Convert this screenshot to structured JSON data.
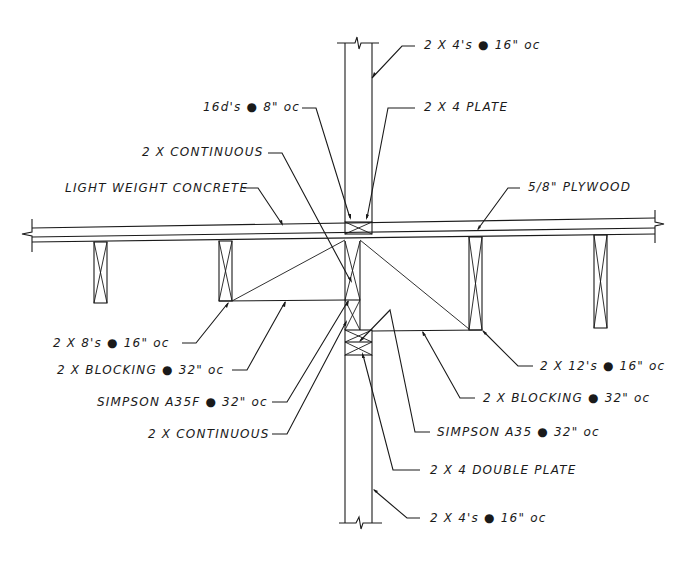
{
  "drawing": {
    "title": "Floor / wall framing section detail",
    "line_color": "#1a1a1a",
    "background": "#ffffff"
  },
  "labels": {
    "top_studs": "2 X 4's ● 16\" oc",
    "nails": "16d's ● 8\" oc",
    "top_plate": "2 X 4 PLATE",
    "continuous_upper": "2 X CONTINUOUS",
    "concrete": "LIGHT WEIGHT CONCRETE",
    "plywood": "5/8\" PLYWOOD",
    "joists_left": "2 X 8's ● 16\" oc",
    "blocking_left": "2 X BLOCKING ● 32\" oc",
    "simpson_a35f": "SIMPSON A35F ● 32\" oc",
    "continuous_lower": "2 X CONTINUOUS",
    "joists_right": "2 X 12's ● 16\" oc",
    "blocking_right": "2 X BLOCKING ● 32\" oc",
    "simpson_a35": "SIMPSON A35 ● 32\" oc",
    "double_plate": "2 X 4 DOUBLE PLATE",
    "bottom_studs": "2 X 4's ● 16\" oc"
  }
}
